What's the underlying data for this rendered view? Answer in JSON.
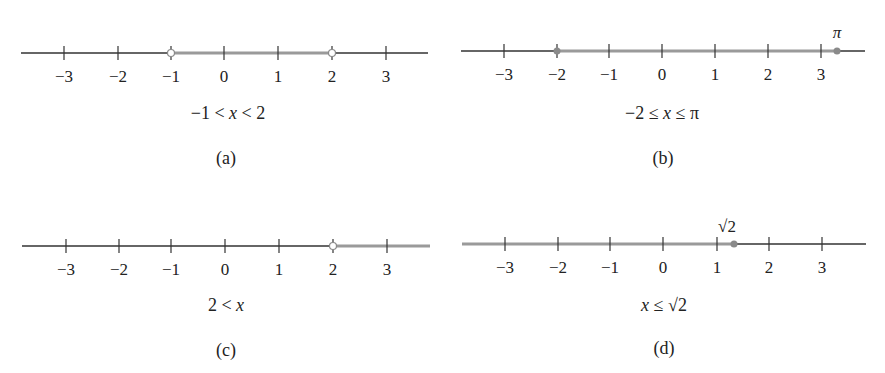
{
  "colors": {
    "axis": "#333333",
    "highlight": "#9a9a9a",
    "background": "#ffffff"
  },
  "panels": [
    {
      "id": "a",
      "caption": "(a)",
      "expression": "−1 < x < 2",
      "expression_parts": [
        "−1 < ",
        "x",
        " < 2"
      ],
      "ticks": [
        "−3",
        "−2",
        "−1",
        "0",
        "1",
        "2",
        "3"
      ],
      "interval": {
        "from": -1,
        "to": 2,
        "from_closed": false,
        "to_closed": false
      },
      "point_label": ""
    },
    {
      "id": "b",
      "caption": "(b)",
      "expression": "−2 ≤ x ≤ π",
      "expression_parts": [
        "−2 ≤ ",
        "x",
        " ≤ π"
      ],
      "ticks": [
        "−3",
        "−2",
        "−1",
        "0",
        "1",
        "2",
        "3"
      ],
      "interval": {
        "from": -2,
        "to": 3.14159,
        "from_closed": true,
        "to_closed": true
      },
      "point_label": "π"
    },
    {
      "id": "c",
      "caption": "(c)",
      "expression": "2 < x",
      "expression_parts": [
        "2 < ",
        "x",
        ""
      ],
      "ticks": [
        "−3",
        "−2",
        "−1",
        "0",
        "1",
        "2",
        "3"
      ],
      "interval": {
        "from": 2,
        "to": "+inf",
        "from_closed": false
      },
      "point_label": ""
    },
    {
      "id": "d",
      "caption": "(d)",
      "expression": "x ≤ √2",
      "expression_parts": [
        "",
        "x",
        " ≤ √2"
      ],
      "ticks": [
        "−3",
        "−2",
        "−1",
        "0",
        "1",
        "2",
        "3"
      ],
      "interval": {
        "from": "-inf",
        "to": 1.41421,
        "to_closed": true
      },
      "point_label": "√2"
    }
  ]
}
